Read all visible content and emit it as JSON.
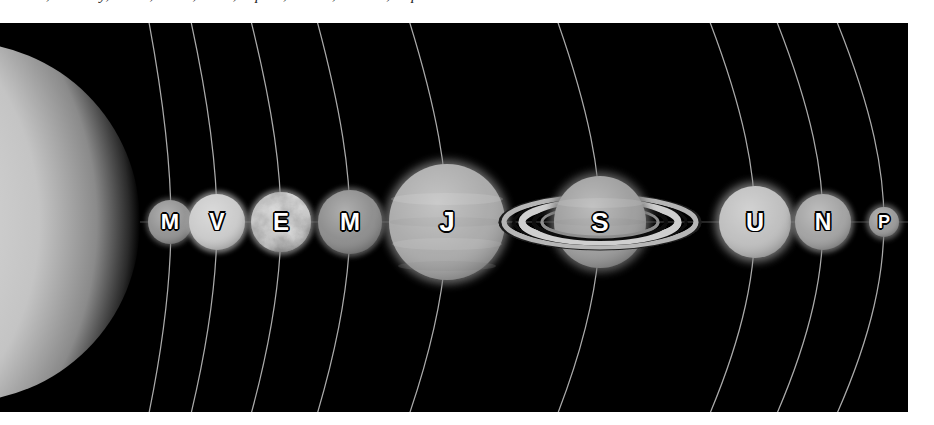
{
  "caption": {
    "text": "the Sun, Mercury, Venus, Earth, Mars, Jupiter, Saturn, Uranus, Neptune and Pluto shown to scale"
  },
  "figure": {
    "background_color": "#000000",
    "page_color": "#ffffff",
    "orbit_line_color": "#c8c8c8",
    "ecliptic_line_color": "#555555",
    "label_color": "#ffffff",
    "label_outline_color": "#000000",
    "plate": {
      "x": 0,
      "y": 23,
      "width": 908,
      "height": 389
    },
    "ecliptic_y": 222
  },
  "sun": {
    "name": "Sun",
    "label": "",
    "center_x": -40,
    "center_y": 222,
    "radius": 180,
    "color": "#d9d9d9"
  },
  "bodies": [
    {
      "name": "Mercury",
      "label": "M",
      "cx": 170,
      "cy": 222,
      "r": 22,
      "color": "#8f8f8f",
      "font_size": 22,
      "has_rings": false,
      "textured": false
    },
    {
      "name": "Venus",
      "label": "V",
      "cx": 217,
      "cy": 222,
      "r": 28,
      "color": "#c9c9c9",
      "font_size": 23,
      "has_rings": false,
      "textured": false
    },
    {
      "name": "Earth",
      "label": "E",
      "cx": 281,
      "cy": 222,
      "r": 30,
      "color": "#b5b5b5",
      "font_size": 24,
      "has_rings": false,
      "textured": true
    },
    {
      "name": "Mars",
      "label": "M",
      "cx": 350,
      "cy": 222,
      "r": 32,
      "color": "#8a8a8a",
      "font_size": 24,
      "has_rings": false,
      "textured": false
    },
    {
      "name": "Jupiter",
      "label": "J",
      "cx": 447,
      "cy": 222,
      "r": 58,
      "color": "#a8a8a8",
      "font_size": 28,
      "has_rings": false,
      "textured": false
    },
    {
      "name": "Saturn",
      "label": "S",
      "cx": 600,
      "cy": 222,
      "r": 46,
      "color": "#9b9b9b",
      "font_size": 26,
      "has_rings": true,
      "textured": false
    },
    {
      "name": "Uranus",
      "label": "U",
      "cx": 755,
      "cy": 222,
      "r": 36,
      "color": "#bdbdbd",
      "font_size": 25,
      "has_rings": false,
      "textured": false
    },
    {
      "name": "Neptune",
      "label": "N",
      "cx": 823,
      "cy": 222,
      "r": 28,
      "color": "#a0a0a0",
      "font_size": 23,
      "has_rings": false,
      "textured": false
    },
    {
      "name": "Pluto",
      "label": "P",
      "cx": 884,
      "cy": 222,
      "r": 15,
      "color": "#969696",
      "font_size": 18,
      "has_rings": false,
      "textured": false
    }
  ],
  "saturn_rings": {
    "outer_rx": 100,
    "outer_ry": 27,
    "inner_rx": 62,
    "inner_ry": 16,
    "color": "#b0b0b0",
    "gap_color": "#101010"
  },
  "orbits": [
    {
      "body": "Mercury",
      "x_at_ecliptic": 170
    },
    {
      "body": "Venus",
      "x_at_ecliptic": 217
    },
    {
      "body": "Earth",
      "x_at_ecliptic": 281
    },
    {
      "body": "Mars",
      "x_at_ecliptic": 350
    },
    {
      "body": "Jupiter",
      "x_at_ecliptic": 447
    },
    {
      "body": "Saturn",
      "x_at_ecliptic": 600
    },
    {
      "body": "Uranus",
      "x_at_ecliptic": 755
    },
    {
      "body": "Neptune",
      "x_at_ecliptic": 823
    },
    {
      "body": "Pluto",
      "x_at_ecliptic": 884
    }
  ]
}
